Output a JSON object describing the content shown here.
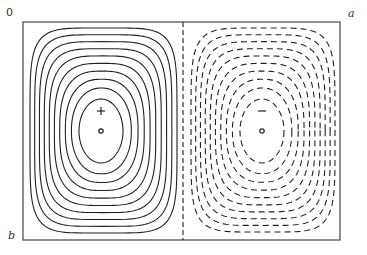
{
  "diagram": {
    "type": "streamline-contour-plot",
    "labels": {
      "origin": "0",
      "x_axis_end": "a",
      "y_axis_end": "b"
    },
    "frame": {
      "left": 23,
      "top": 22,
      "right": 340,
      "bottom": 240,
      "divider_x": 183
    },
    "cells": [
      {
        "name": "left-cell",
        "sign": "+",
        "line_style": "solid",
        "center": [
          101,
          131
        ],
        "sign_marker_pos": [
          101,
          111
        ],
        "contour_count": 10,
        "inner_ellipse": {
          "rx": 22,
          "ry": 32
        },
        "outer_box": {
          "x0": 30,
          "y0": 28,
          "x1": 177,
          "y1": 233
        }
      },
      {
        "name": "right-cell",
        "sign": "−",
        "line_style": "dashed",
        "center": [
          262,
          131
        ],
        "sign_marker_pos": [
          262,
          111
        ],
        "contour_count": 10,
        "inner_ellipse": {
          "rx": 22,
          "ry": 32
        },
        "outer_box": {
          "x0": 191,
          "y0": 28,
          "x1": 335,
          "y1": 232
        }
      }
    ],
    "colors": {
      "line": "#222222",
      "frame": "#444444",
      "background": "#ffffff"
    }
  }
}
